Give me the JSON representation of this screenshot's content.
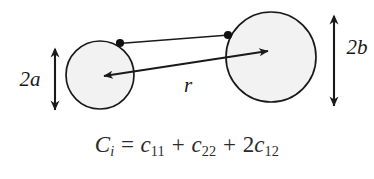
{
  "figure": {
    "type": "two-circle-correlation-diagram",
    "background_color": "#ffffff",
    "stroke_color": "#1a1a1a",
    "circle_fill_color": "#f2f2f2",
    "labels": {
      "left_diameter": "2a",
      "right_diameter": "2b",
      "separation": "r"
    },
    "shapes": {
      "left_circle": {
        "cx": 100,
        "cy": 75,
        "r": 34,
        "name": "small-circle"
      },
      "right_circle": {
        "cx": 271,
        "cy": 57,
        "r": 45,
        "name": "large-circle"
      },
      "left_edge_dot": {
        "cx": 120,
        "cy": 43
      },
      "right_edge_dot": {
        "cx": 228,
        "cy": 35
      }
    }
  },
  "formula": {
    "full_text": "C_i = c_11 + c_22 + 2c_12",
    "lhs_symbol": "C",
    "lhs_subscript": "i",
    "equals": "=",
    "term1_symbol": "c",
    "term1_subscript": "11",
    "plus1": "+",
    "term2_symbol": "c",
    "term2_subscript": "22",
    "plus2": "+",
    "term3_coefficient": "2",
    "term3_symbol": "c",
    "term3_subscript": "12"
  }
}
